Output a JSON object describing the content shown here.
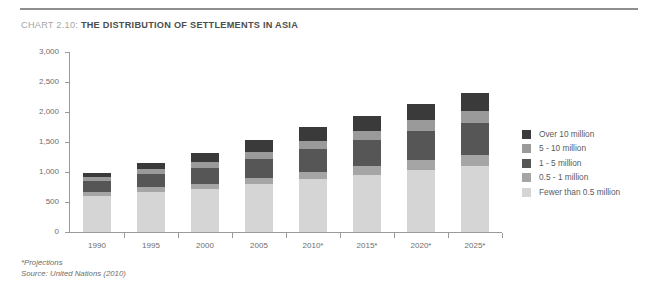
{
  "header": {
    "chart_label": "CHART 2.10:",
    "chart_headline": "THE DISTRIBUTION OF SETTLEMENTS IN ASIA",
    "rule_color": "#8e8e8e"
  },
  "footnotes": {
    "projections": "*Projections",
    "source": "Source: United Nations (2010)"
  },
  "legend": {
    "position": "right",
    "items": [
      {
        "label": "Over 10 million",
        "color": "#3a3a3a"
      },
      {
        "label": "5 - 10 million",
        "color": "#9a9a9a"
      },
      {
        "label": "1 - 5 million",
        "color": "#565656"
      },
      {
        "label": "0.5 - 1 million",
        "color": "#a5a5a5"
      },
      {
        "label": "Fewer than 0.5 million",
        "color": "#d5d5d5"
      }
    ]
  },
  "chart_data": {
    "type": "bar",
    "subtype": "stacked-vertical",
    "title": "CHART 2.10: THE DISTRIBUTION OF SETTLEMENTS IN ASIA",
    "xlabel": "",
    "ylabel": "Population (thousands)",
    "ylim": [
      0,
      3000
    ],
    "yticks": [
      0,
      500,
      1000,
      1500,
      2000,
      2500,
      3000
    ],
    "ytick_labels": [
      "0",
      "500",
      "1,000",
      "1,500",
      "2,000",
      "2,500",
      "3,000"
    ],
    "grid": false,
    "categories": [
      "1990",
      "1995",
      "2000",
      "2005",
      "2010*",
      "2015*",
      "2020*",
      "2025*"
    ],
    "series": [
      {
        "name": "Fewer than 0.5 million",
        "color": "#d5d5d5",
        "values": [
          600,
          670,
          720,
          800,
          880,
          950,
          1030,
          1100
        ]
      },
      {
        "name": "0.5 - 1 million",
        "color": "#a5a5a5",
        "values": [
          65,
          75,
          85,
          95,
          120,
          150,
          175,
          190
        ]
      },
      {
        "name": "1 - 5 million",
        "color": "#565656",
        "values": [
          190,
          230,
          270,
          320,
          380,
          430,
          480,
          530
        ]
      },
      {
        "name": "5 - 10 million",
        "color": "#9a9a9a",
        "values": [
          60,
          75,
          95,
          115,
          135,
          150,
          180,
          195
        ]
      },
      {
        "name": "Over 10 million",
        "color": "#3a3a3a",
        "values": [
          70,
          100,
          150,
          200,
          230,
          250,
          270,
          300
        ]
      }
    ],
    "totals": [
      985,
      1150,
      1320,
      1530,
      1745,
      1930,
      2135,
      2315
    ]
  }
}
